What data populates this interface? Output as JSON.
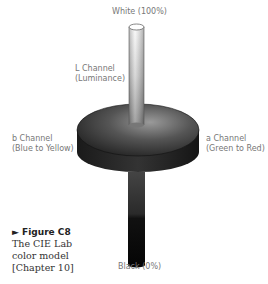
{
  "diagram": {
    "title": "CIE Lab color model",
    "labels": {
      "top": "White (100%)",
      "bottom": "Black (0%)",
      "l_channel": [
        "L Channel",
        "(Luminance)"
      ],
      "b_channel": [
        "b Channel",
        "(Blue to Yellow)"
      ],
      "a_channel": [
        "a Channel",
        "(Green to Red)"
      ]
    },
    "caption": {
      "marker": "►",
      "figure": "Figure C8",
      "lines": [
        "The CIE Lab",
        "color model",
        "[Chapter 10]"
      ]
    }
  }
}
